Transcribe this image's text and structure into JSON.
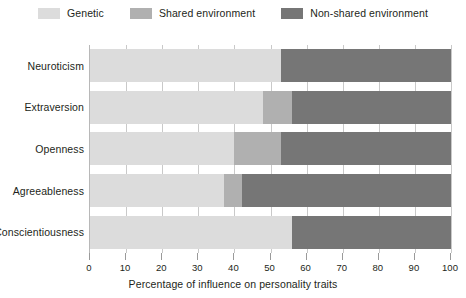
{
  "chart_data": {
    "type": "bar",
    "orientation": "horizontal",
    "stacked": true,
    "title": "",
    "xlabel": "Percentage of influence on personality traits",
    "ylabel": "",
    "xlim": [
      0,
      100
    ],
    "xticks": [
      0,
      10,
      20,
      30,
      40,
      50,
      60,
      70,
      80,
      90,
      100
    ],
    "xtick_labels": [
      "0",
      "10",
      "20",
      "30",
      "40",
      "50",
      "60",
      "70",
      "80",
      "90",
      "100"
    ],
    "grid": true,
    "grid_axis": "x",
    "legend_position": "top-center",
    "categories": [
      "Neuroticism",
      "Extraversion",
      "Openness",
      "Agreeableness",
      "Conscientiousness"
    ],
    "series": [
      {
        "name": "Genetic",
        "color": "#dcdcdc",
        "values": [
          53,
          48,
          40,
          37,
          56
        ]
      },
      {
        "name": "Shared environment",
        "color": "#b0b0b0",
        "values": [
          0,
          8,
          13,
          5,
          0
        ]
      },
      {
        "name": "Non-shared environment",
        "color": "#767676",
        "values": [
          47,
          44,
          47,
          58,
          44
        ]
      }
    ]
  },
  "legend": {
    "items": [
      {
        "label": "Genetic",
        "color": "#dcdcdc"
      },
      {
        "label": "Shared environment",
        "color": "#b0b0b0"
      },
      {
        "label": "Non-shared environment",
        "color": "#767676"
      }
    ]
  },
  "axis": {
    "x_title": "Percentage of influence on personality traits",
    "x_tick_labels": [
      "0",
      "10",
      "20",
      "30",
      "40",
      "50",
      "60",
      "70",
      "80",
      "90",
      "100"
    ],
    "y_tick_labels": [
      "Neuroticism",
      "Extraversion",
      "Openness",
      "Agreeableness",
      "Conscientiousness"
    ]
  },
  "colors": {
    "genetic": "#dcdcdc",
    "shared": "#b0b0b0",
    "non_shared": "#767676",
    "grid": "#c9c9c9",
    "axis": "#b8b8b8",
    "text": "#231f20",
    "background": "#ffffff"
  }
}
